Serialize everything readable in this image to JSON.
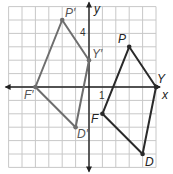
{
  "diagram": {
    "type": "coordinate-plane-reflection",
    "grid": {
      "xmin": -6,
      "xmax": 5,
      "ymin": -6,
      "ymax": 6,
      "unit_px": 13.4,
      "origin_px": [
        89,
        87
      ]
    },
    "axes": {
      "x_label": "x",
      "y_label": "y"
    },
    "ticks": {
      "x_tick": "1",
      "y_tick": "4"
    },
    "figures": [
      {
        "name": "PYDF",
        "color": "#2a2a2a",
        "vertices": [
          {
            "label": "P",
            "x": 3,
            "y": 3
          },
          {
            "label": "Y",
            "x": 5,
            "y": 0
          },
          {
            "label": "D",
            "x": 4,
            "y": -5
          },
          {
            "label": "F",
            "x": 1,
            "y": -2
          }
        ]
      },
      {
        "name": "P'Y'D'F'",
        "color": "#6e6e6e",
        "vertices": [
          {
            "label": "P′",
            "x": -2,
            "y": 5
          },
          {
            "label": "Y′",
            "x": 0,
            "y": 2
          },
          {
            "label": "D′",
            "x": -1,
            "y": -3
          },
          {
            "label": "F′",
            "x": -4,
            "y": 0
          }
        ]
      }
    ]
  },
  "labels": {
    "P": "P",
    "Y": "Y",
    "D": "D",
    "F": "F",
    "Pp": "P′",
    "Yp": "Y′",
    "Dp": "D′",
    "Fp": "F′",
    "x": "x",
    "y": "y",
    "tick1": "1",
    "tick4": "4"
  }
}
